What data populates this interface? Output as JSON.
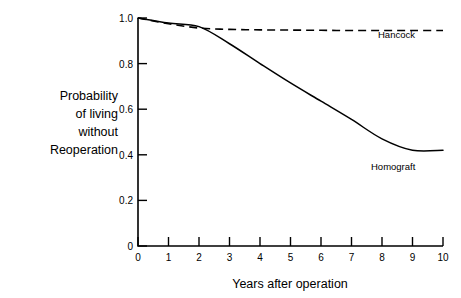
{
  "chart_data": {
    "type": "line",
    "title": "",
    "xlabel": "Years after operation",
    "ylabel": "Probability of living without Reoperation",
    "ylabel_lines": [
      "Probability",
      "of living",
      "without",
      "Reoperation"
    ],
    "xlim": [
      0,
      10
    ],
    "ylim": [
      0,
      1.0
    ],
    "grid": false,
    "legend_position": "inline-annotation",
    "x": [
      0,
      1,
      2,
      3,
      4,
      5,
      6,
      7,
      8,
      9,
      10
    ],
    "xticks": [
      "0",
      "1",
      "2",
      "3",
      "4",
      "5",
      "6",
      "7",
      "8",
      "9",
      "10"
    ],
    "yticks": [
      "1.0",
      "0.8",
      "0.6",
      "0.4",
      "0.2",
      "0"
    ],
    "ytick_values": [
      1.0,
      0.8,
      0.6,
      0.4,
      0.2,
      0
    ],
    "series": [
      {
        "name": "Hancock",
        "style": "dashed",
        "color": "#000000",
        "annotation": "Hancock",
        "values": [
          1.0,
          0.975,
          0.956,
          0.95,
          0.948,
          0.947,
          0.946,
          0.945,
          0.945,
          0.945,
          0.945
        ]
      },
      {
        "name": "Homograft",
        "style": "solid",
        "color": "#000000",
        "annotation": "Homograft",
        "values": [
          1.0,
          0.978,
          0.962,
          0.887,
          0.8,
          0.715,
          0.635,
          0.555,
          0.47,
          0.42,
          0.42
        ]
      }
    ]
  },
  "annotations": {
    "hancock_label": "Hancock",
    "homograft_label": "Homograft"
  }
}
